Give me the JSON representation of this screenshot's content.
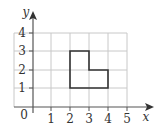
{
  "diagram": {
    "type": "coordinate-grid",
    "axes": {
      "x_label": "x",
      "y_label": "y",
      "origin_label": "0"
    },
    "x_ticks": [
      "1",
      "2",
      "3",
      "4",
      "5"
    ],
    "y_ticks": [
      "1",
      "2",
      "3",
      "4"
    ],
    "shape": {
      "name": "L-shaped polygon",
      "vertices": [
        [
          2,
          1
        ],
        [
          4,
          1
        ],
        [
          4,
          2
        ],
        [
          3,
          2
        ],
        [
          3,
          3
        ],
        [
          2,
          3
        ]
      ]
    },
    "colors": {
      "grid": "#c8c8c8",
      "axis": "#555555",
      "shape": "#333333"
    }
  }
}
